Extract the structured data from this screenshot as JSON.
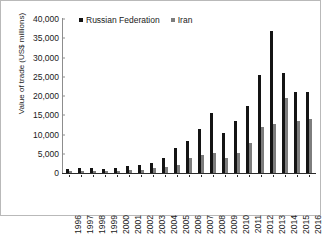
{
  "chart_data": {
    "type": "bar",
    "title": "",
    "xlabel": "",
    "ylabel": "Value of trade (US$ millions)",
    "ylim": [
      0,
      40000
    ],
    "ytick_labels": [
      "40,000",
      "35,000",
      "30,000",
      "25,000",
      "20,000",
      "15,000",
      "10,000",
      "5,000",
      "0"
    ],
    "ytick_values": [
      40000,
      35000,
      30000,
      25000,
      20000,
      15000,
      10000,
      5000,
      0
    ],
    "grid": false,
    "legend_position": "top-left",
    "categories": [
      "1996",
      "1997",
      "1998",
      "1999",
      "2000",
      "2001",
      "2002",
      "2003",
      "2004",
      "2005",
      "2006",
      "2007",
      "2008",
      "2009",
      "2010",
      "2011",
      "2012",
      "2013",
      "2014",
      "2015",
      "2016"
    ],
    "series": [
      {
        "name": "Russian Federation",
        "color": "#141414",
        "values": [
          1100,
          1300,
          1200,
          1000,
          1300,
          1800,
          2100,
          2600,
          3800,
          6500,
          8200,
          11500,
          15500,
          10500,
          13500,
          17500,
          25500,
          37000,
          26000,
          21000,
          21000
        ]
      },
      {
        "name": "Iran",
        "color": "#7d7d7d",
        "values": [
          600,
          600,
          550,
          500,
          600,
          700,
          900,
          1200,
          1500,
          2100,
          3800,
          4800,
          5200,
          4000,
          5200,
          7800,
          12000,
          12800,
          19500,
          13500,
          14000
        ]
      }
    ]
  },
  "legend": {
    "items": [
      {
        "label": "Russian Federation",
        "color": "#141414"
      },
      {
        "label": "Iran",
        "color": "#7d7d7d"
      }
    ]
  }
}
